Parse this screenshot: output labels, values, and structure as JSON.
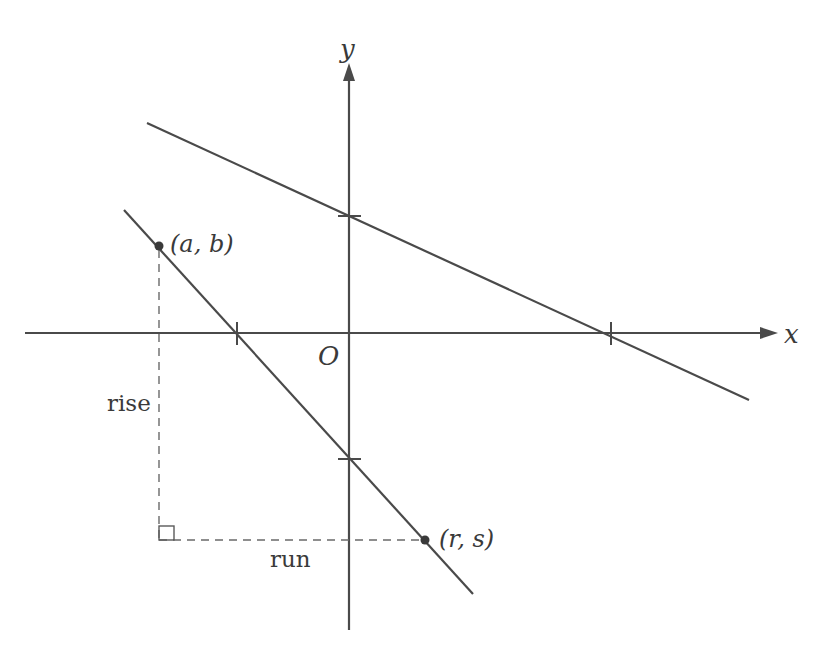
{
  "figure": {
    "type": "coordinate-plane-slope-diagram",
    "colors": {
      "line": "#4a4a4a",
      "dash": "#6a6a6a",
      "text": "#3a3a3a",
      "background": "#ffffff"
    },
    "axes": {
      "x_label": "x",
      "y_label": "y",
      "origin_label": "O"
    },
    "lines": [
      {
        "name": "upper-line",
        "from": [
          147,
          123
        ],
        "to": [
          749,
          400
        ],
        "x_intercept_tick": 611,
        "y_intercept_tick": 216
      },
      {
        "name": "lower-line",
        "from": [
          124,
          210
        ],
        "to": [
          473,
          594
        ],
        "x_intercept_tick": 237,
        "y_intercept_tick": 459
      }
    ],
    "points": [
      {
        "label": "(a, b)",
        "name": "point-a-b",
        "pos": [
          159,
          246
        ]
      },
      {
        "label": "(r, s)",
        "name": "point-r-s",
        "pos": [
          425,
          540
        ]
      }
    ],
    "annotations": {
      "rise": "rise",
      "run": "run"
    }
  }
}
